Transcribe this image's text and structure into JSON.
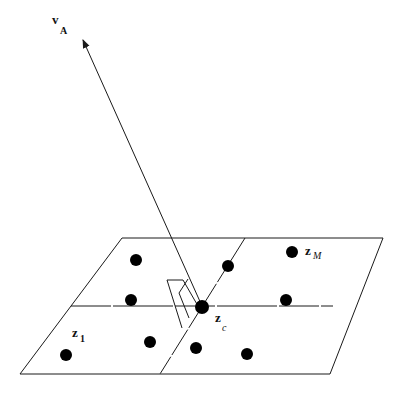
{
  "diagram": {
    "colors": {
      "stroke": "#1a1a1a",
      "fill": "#000000",
      "background": "#ffffff"
    },
    "labels": {
      "vector": {
        "main": "v",
        "sub": "A"
      },
      "center": {
        "main": "z",
        "sub": "c"
      },
      "last": {
        "main": "z",
        "sub": "M"
      },
      "first": {
        "main": "z",
        "sub": "1"
      }
    },
    "plane": {
      "corners": [
        [
          122,
          238
        ],
        [
          383,
          238
        ],
        [
          330,
          374
        ],
        [
          20,
          374
        ]
      ],
      "horizontal_divider": [
        [
          71,
          306
        ],
        [
          333,
          306
        ]
      ],
      "slanted_divider": [
        [
          245,
          238
        ],
        [
          160,
          374
        ]
      ]
    },
    "arrow": {
      "from": [
        202,
        306
      ],
      "to": [
        83,
        40
      ]
    },
    "right_angle_marker": [
      [
        167,
        280
      ],
      [
        183,
        280
      ],
      [
        198,
        306
      ]
    ],
    "points": [
      {
        "id": "p1",
        "x": 136,
        "y": 260
      },
      {
        "id": "p2",
        "x": 228,
        "y": 266
      },
      {
        "id": "zM",
        "x": 292,
        "y": 252
      },
      {
        "id": "p4",
        "x": 131,
        "y": 300
      },
      {
        "id": "zc",
        "x": 202,
        "y": 307
      },
      {
        "id": "p6",
        "x": 286,
        "y": 300
      },
      {
        "id": "z1",
        "x": 66,
        "y": 355
      },
      {
        "id": "p8",
        "x": 150,
        "y": 342
      },
      {
        "id": "p9",
        "x": 196,
        "y": 348
      },
      {
        "id": "p10",
        "x": 247,
        "y": 354
      }
    ]
  }
}
